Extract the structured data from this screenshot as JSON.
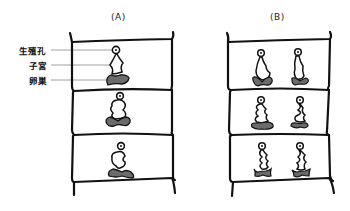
{
  "figure": {
    "panels": [
      {
        "id": "A",
        "label": "(A)",
        "segments": 3,
        "organs_per_segment": 1,
        "description": "Single set of reproductive organs per segment"
      },
      {
        "id": "B",
        "label": "(B)",
        "segments": 3,
        "organs_per_segment": 2,
        "description": "Paired sets of reproductive organs per segment"
      }
    ],
    "labels": {
      "genital_pore": "生殖孔",
      "uterus": "子宮",
      "ovary": "卵巣"
    },
    "colors": {
      "outline": "#111111",
      "ovary_fill": "#6b6b6b",
      "leader_line": "#888888",
      "background": "#ffffff"
    }
  }
}
